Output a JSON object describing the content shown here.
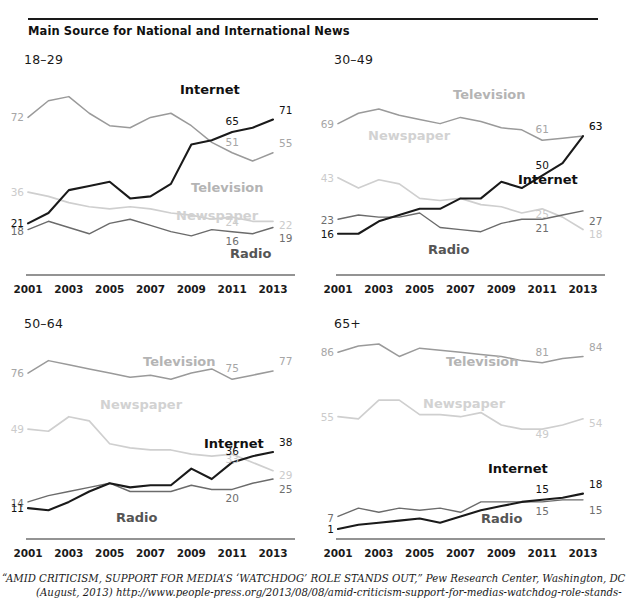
{
  "figure": {
    "title": "Main Source for National and International News"
  },
  "footer": {
    "line1": "“AMID CRITICISM, SUPPORT FOR MEDIA’S ‘WATCHDOG’ ROLE STANDS OUT,” Pew Research Center, Washington, DC",
    "line2": "(August, 2013) http://www.people-press.org/2013/08/08/amid-criticism-support-for-medias-watchdog-role-stands-out/."
  },
  "colors": {
    "internet": "#1a1a1a",
    "television": "#9a9a9a",
    "newspaper": "#cfcfcf",
    "radio": "#6b6b6b",
    "axis": "#6f6f6f",
    "rule": "#1a1a1a"
  },
  "axis": {
    "tick_labels": [
      "2001",
      "2003",
      "2005",
      "2007",
      "2009",
      "2011",
      "2013"
    ],
    "x_values": [
      2001,
      2002,
      2003,
      2004,
      2005,
      2006,
      2007,
      2008,
      2009,
      2010,
      2011,
      2012,
      2013
    ],
    "ylim": [
      0,
      90
    ]
  },
  "series_labels": {
    "internet": "Internet",
    "television": "Television",
    "newspaper": "Newspaper",
    "radio": "Radio"
  },
  "chart_data": [
    {
      "type": "line",
      "panel": "18-29",
      "title": "18–29",
      "xlabel": "",
      "ylabel": "",
      "ylim": [
        0,
        90
      ],
      "grid": false,
      "legend": "inline-annotations",
      "x": [
        2001,
        2002,
        2003,
        2004,
        2005,
        2006,
        2007,
        2008,
        2009,
        2010,
        2011,
        2012,
        2013
      ],
      "series": [
        {
          "name": "Television",
          "values": [
            72,
            80,
            82,
            74,
            68,
            67,
            72,
            74,
            68,
            60,
            55,
            51,
            55
          ],
          "endpoint_labels": {
            "start": "72",
            "near_end": "51",
            "end": "55"
          }
        },
        {
          "name": "Newspaper",
          "values": [
            36,
            34,
            31,
            29,
            28,
            29,
            28,
            26,
            25,
            23,
            24,
            22,
            22
          ],
          "endpoint_labels": {
            "start": "36",
            "near_end": "24",
            "end": "22"
          }
        },
        {
          "name": "Internet",
          "values": [
            21,
            26,
            37,
            39,
            41,
            33,
            34,
            40,
            59,
            61,
            65,
            67,
            71
          ],
          "endpoint_labels": {
            "start": "21",
            "near_end": "65",
            "end": "71"
          }
        },
        {
          "name": "Radio",
          "values": [
            18,
            22,
            19,
            16,
            21,
            23,
            20,
            17,
            15,
            18,
            17,
            16,
            19
          ],
          "endpoint_labels": {
            "start": "18",
            "near_end": "16",
            "end": "19"
          }
        }
      ]
    },
    {
      "type": "line",
      "panel": "30-49",
      "title": "30–49",
      "xlabel": "",
      "ylabel": "",
      "ylim": [
        0,
        90
      ],
      "grid": false,
      "legend": "inline-annotations",
      "x": [
        2001,
        2002,
        2003,
        2004,
        2005,
        2006,
        2007,
        2008,
        2009,
        2010,
        2011,
        2012,
        2013
      ],
      "series": [
        {
          "name": "Television",
          "values": [
            69,
            74,
            76,
            73,
            71,
            69,
            72,
            70,
            67,
            66,
            61,
            62,
            63
          ],
          "endpoint_labels": {
            "start": "69",
            "near_end": "61",
            "end": "63"
          }
        },
        {
          "name": "Newspaper",
          "values": [
            43,
            38,
            42,
            40,
            33,
            32,
            33,
            30,
            29,
            26,
            28,
            24,
            18
          ],
          "endpoint_labels": {
            "start": "43",
            "near_end": "25",
            "end": "18"
          }
        },
        {
          "name": "Internet",
          "values": [
            16,
            16,
            22,
            25,
            28,
            28,
            33,
            33,
            41,
            38,
            44,
            50,
            63
          ],
          "endpoint_labels": {
            "start": "16",
            "near_end": "50",
            "end": "63"
          }
        },
        {
          "name": "Radio",
          "values": [
            23,
            25,
            24,
            24,
            26,
            19,
            18,
            17,
            21,
            23,
            23,
            25,
            27
          ],
          "endpoint_labels": {
            "start": "23",
            "near_end": "21",
            "end": "27"
          }
        }
      ]
    },
    {
      "type": "line",
      "panel": "50-64",
      "title": "50–64",
      "xlabel": "",
      "ylabel": "",
      "ylim": [
        0,
        90
      ],
      "grid": false,
      "legend": "inline-annotations",
      "x": [
        2001,
        2002,
        2003,
        2004,
        2005,
        2006,
        2007,
        2008,
        2009,
        2010,
        2011,
        2012,
        2013
      ],
      "series": [
        {
          "name": "Television",
          "values": [
            76,
            82,
            80,
            78,
            76,
            74,
            75,
            73,
            76,
            78,
            73,
            75,
            77
          ],
          "endpoint_labels": {
            "start": "76",
            "near_end": "75",
            "end": "77"
          }
        },
        {
          "name": "Newspaper",
          "values": [
            49,
            48,
            55,
            53,
            42,
            40,
            39,
            39,
            37,
            36,
            37,
            33,
            29
          ],
          "endpoint_labels": {
            "start": "49",
            "near_end": "33",
            "end": "29"
          }
        },
        {
          "name": "Internet",
          "values": [
            11,
            10,
            14,
            19,
            23,
            21,
            22,
            22,
            30,
            25,
            33,
            36,
            38
          ],
          "endpoint_labels": {
            "start": "11",
            "near_end": "36",
            "end": "38"
          }
        },
        {
          "name": "Radio",
          "values": [
            14,
            17,
            19,
            21,
            23,
            19,
            19,
            19,
            22,
            20,
            20,
            23,
            25
          ],
          "endpoint_labels": {
            "start": "14",
            "near_end": "20",
            "end": "25"
          }
        }
      ]
    },
    {
      "type": "line",
      "panel": "65+",
      "title": "65+",
      "xlabel": "",
      "ylabel": "",
      "ylim": [
        0,
        90
      ],
      "grid": false,
      "legend": "inline-annotations",
      "x": [
        2001,
        2002,
        2003,
        2004,
        2005,
        2006,
        2007,
        2008,
        2009,
        2010,
        2011,
        2012,
        2013
      ],
      "series": [
        {
          "name": "Television",
          "values": [
            86,
            89,
            90,
            84,
            88,
            87,
            86,
            85,
            84,
            82,
            81,
            83,
            84
          ],
          "endpoint_labels": {
            "start": "86",
            "near_end": "81",
            "end": "84"
          }
        },
        {
          "name": "Newspaper",
          "values": [
            55,
            54,
            63,
            63,
            56,
            56,
            55,
            57,
            51,
            49,
            49,
            51,
            54
          ],
          "endpoint_labels": {
            "start": "55",
            "near_end": "49",
            "end": "54"
          }
        },
        {
          "name": "Internet",
          "values": [
            1,
            3,
            4,
            5,
            6,
            4,
            7,
            10,
            12,
            14,
            15,
            16,
            18
          ],
          "endpoint_labels": {
            "start": "1",
            "near_end": "15",
            "end": "18"
          }
        },
        {
          "name": "Radio",
          "values": [
            7,
            11,
            9,
            11,
            10,
            11,
            9,
            14,
            14,
            14,
            14,
            15,
            15
          ],
          "endpoint_labels": {
            "start": "7",
            "near_end": "15",
            "end": "15"
          }
        }
      ]
    }
  ]
}
